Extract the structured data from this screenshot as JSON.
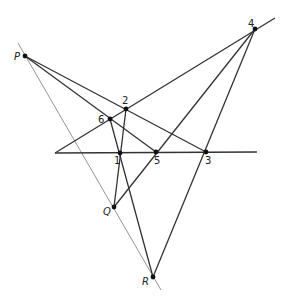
{
  "diagram": {
    "stroke_color": "#333333",
    "guide_color": "#888888",
    "points": {
      "P": {
        "label": "P",
        "x": 25,
        "y": 56,
        "lx": 14,
        "ly": 60
      },
      "Q": {
        "label": "Q",
        "x": 114,
        "y": 207,
        "lx": 103,
        "ly": 215
      },
      "R": {
        "label": "R",
        "x": 153,
        "y": 277,
        "lx": 142,
        "ly": 285
      },
      "1": {
        "label": "1",
        "x": 120,
        "y": 153,
        "lx": 114,
        "ly": 164
      },
      "2": {
        "label": "2",
        "x": 126,
        "y": 109,
        "lx": 122,
        "ly": 104
      },
      "3": {
        "label": "3",
        "x": 206,
        "y": 152,
        "lx": 205,
        "ly": 164
      },
      "4": {
        "label": "4",
        "x": 255,
        "y": 29,
        "lx": 248,
        "ly": 27
      },
      "5": {
        "label": "5",
        "x": 156,
        "y": 152,
        "lx": 154,
        "ly": 164
      },
      "6": {
        "label": "6",
        "x": 110,
        "y": 119,
        "lx": 98,
        "ly": 123
      }
    },
    "lines": [
      {
        "id": "guide-PQR",
        "x1": 18,
        "y1": 43,
        "x2": 161,
        "y2": 290,
        "guide": true
      },
      {
        "id": "axis-135",
        "x1": 55,
        "y1": 153,
        "x2": 257,
        "y2": 152
      },
      {
        "id": "line-624",
        "x1": 55,
        "y1": 153,
        "x2": 275,
        "y2": 18
      },
      {
        "id": "line-P23",
        "x1": 25,
        "y1": 56,
        "x2": 206,
        "y2": 152
      },
      {
        "id": "line-P65",
        "x1": 25,
        "y1": 56,
        "x2": 156,
        "y2": 152
      },
      {
        "id": "line-4Q",
        "x1": 255,
        "y1": 29,
        "x2": 114,
        "y2": 207
      },
      {
        "id": "line-4R",
        "x1": 255,
        "y1": 29,
        "x2": 153,
        "y2": 277
      },
      {
        "id": "line-61R",
        "x1": 110,
        "y1": 119,
        "x2": 153,
        "y2": 277
      },
      {
        "id": "line-21Q",
        "x1": 126,
        "y1": 109,
        "x2": 114,
        "y2": 207
      }
    ]
  }
}
